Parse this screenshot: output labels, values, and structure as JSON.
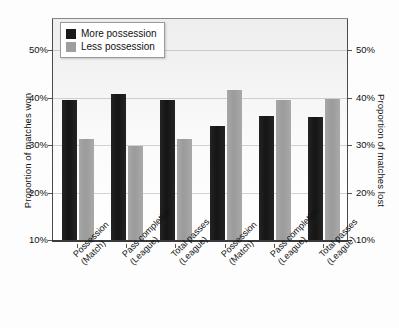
{
  "chart_data": {
    "type": "bar",
    "title": "",
    "subtitle": "",
    "xlabel": "",
    "ylabel": "Proportion of matches won",
    "ylabel_secondary": "Proportion of matches lost",
    "ylim": [
      10,
      50
    ],
    "yticks": [
      "10%",
      "20%",
      "30%",
      "40%",
      "50%"
    ],
    "ytick_values": [
      10,
      20,
      30,
      40,
      50
    ],
    "yticks_secondary": [
      "10%",
      "20%",
      "30%",
      "40%",
      "50%"
    ],
    "grid": true,
    "legend_position": "top-left",
    "categories": [
      "Possession (Match)",
      "Pass completion (League)",
      "Total passes (League)",
      "Possession (Match)",
      "Pass completion (League)",
      "Total passes (League)"
    ],
    "category_lines": [
      [
        "Possession",
        "(Match)"
      ],
      [
        "Pass completion",
        "(League)"
      ],
      [
        "Total passes",
        "(League)"
      ],
      [
        "Possession",
        "(Match)"
      ],
      [
        "Pass completion",
        "(League)"
      ],
      [
        "Total passes",
        "(League)"
      ]
    ],
    "series": [
      {
        "name": "More possession",
        "color": "#1a1a1a",
        "values": [
          39.5,
          40.8,
          39.5,
          34.0,
          36.2,
          35.9
        ]
      },
      {
        "name": "Less possession",
        "color": "#9e9e9e",
        "values": [
          31.3,
          29.8,
          31.3,
          41.5,
          39.5,
          39.6
        ]
      }
    ]
  },
  "legend": {
    "items": [
      {
        "label": "More possession",
        "color": "#1a1a1a"
      },
      {
        "label": "Less possession",
        "color": "#9e9e9e"
      }
    ]
  },
  "axes": {
    "left_title": "Proportion of matches won",
    "right_title": "Proportion of matches lost",
    "ticks": [
      "50%",
      "40%",
      "30%",
      "20%",
      "10%"
    ]
  }
}
